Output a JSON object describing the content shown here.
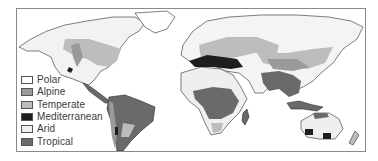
{
  "map": {
    "type": "world-climate-zones-map",
    "colors": {
      "polar": "#ffffff",
      "alpine": "#9a9a9a",
      "temperate": "#bdbdbd",
      "mediterranean": "#1e1e1e",
      "arid": "#efefef",
      "tropical": "#6a6a6a",
      "coastline": "#2a2a2a"
    }
  },
  "legend": {
    "items": [
      {
        "label": "Polar",
        "color": "#ffffff"
      },
      {
        "label": "Alpine",
        "color": "#9a9a9a"
      },
      {
        "label": "Temperate",
        "color": "#bdbdbd"
      },
      {
        "label": "Mediterranean",
        "color": "#1e1e1e"
      },
      {
        "label": "Arid",
        "color": "#efefef"
      },
      {
        "label": "Tropical",
        "color": "#6a6a6a"
      }
    ]
  }
}
